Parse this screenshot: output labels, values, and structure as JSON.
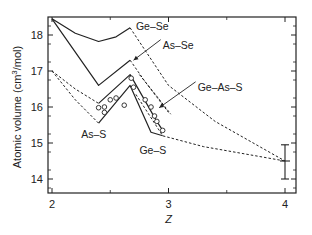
{
  "chart_data": {
    "type": "line",
    "title": "",
    "xlabel": "Z",
    "ylabel": "Atomic volume (cm³/mol)",
    "ylabel_parts": {
      "main": "Atomic volume (cm",
      "sup": "3",
      "tail": "/mol)"
    },
    "xlim": [
      2,
      4.1
    ],
    "ylim": [
      13.6,
      18.5
    ],
    "x_ticks": [
      "2",
      "3",
      "4"
    ],
    "x_tick_values": [
      2,
      3,
      4
    ],
    "y_ticks": [
      "14",
      "15",
      "16",
      "17",
      "18"
    ],
    "y_tick_values": [
      14,
      15,
      16,
      17,
      18
    ],
    "grid": false,
    "legend": "inline labels",
    "series": [
      {
        "name": "Ge–Se",
        "style": "solid",
        "points": [
          [
            2.0,
            18.45
          ],
          [
            2.2,
            18.05
          ],
          [
            2.4,
            17.82
          ],
          [
            2.55,
            17.95
          ],
          [
            2.67,
            18.2
          ]
        ]
      },
      {
        "name": "Ge–Se (extrapolation)",
        "style": "dashed",
        "points": [
          [
            2.67,
            18.2
          ],
          [
            3.0,
            16.6
          ],
          [
            3.4,
            15.6
          ],
          [
            4.0,
            14.5
          ]
        ]
      },
      {
        "name": "As–Se",
        "style": "solid",
        "points": [
          [
            2.0,
            18.45
          ],
          [
            2.4,
            16.6
          ],
          [
            2.67,
            17.3
          ]
        ]
      },
      {
        "name": "As–Se (extrapolation)",
        "style": "dashed",
        "points": [
          [
            2.67,
            17.3
          ],
          [
            2.8,
            16.7
          ],
          [
            3.0,
            15.85
          ]
        ]
      },
      {
        "name": "Ge–As–S",
        "style": "solid",
        "points": [
          [
            2.4,
            16.1
          ],
          [
            2.67,
            16.9
          ],
          [
            2.9,
            15.6
          ],
          [
            2.95,
            15.35
          ]
        ]
      },
      {
        "name": "Ge–As–S (dashed lead)",
        "style": "dashed",
        "points": [
          [
            2.0,
            17.0
          ],
          [
            2.2,
            16.5
          ],
          [
            2.4,
            16.1
          ]
        ]
      },
      {
        "name": "As–S",
        "style": "solid",
        "points": [
          [
            2.4,
            15.55
          ],
          [
            2.67,
            16.6
          ],
          [
            2.85,
            15.3
          ],
          [
            2.95,
            15.2
          ]
        ]
      },
      {
        "name": "As–S (dashed lead)",
        "style": "dashed",
        "points": [
          [
            2.0,
            17.0
          ],
          [
            2.2,
            16.2
          ],
          [
            2.4,
            15.55
          ]
        ]
      },
      {
        "name": "Ge–S (extrapolation)",
        "style": "dashed",
        "points": [
          [
            2.72,
            16.35
          ],
          [
            2.95,
            15.2
          ],
          [
            3.3,
            14.9
          ],
          [
            4.0,
            14.5
          ]
        ]
      },
      {
        "name": "Ge–As–S dashed upper",
        "style": "dashed",
        "points": [
          [
            2.75,
            16.9
          ],
          [
            2.9,
            16.3
          ],
          [
            3.02,
            15.8
          ]
        ]
      }
    ],
    "markers": {
      "symbol": "open-circle",
      "points": [
        [
          2.4,
          15.98
        ],
        [
          2.45,
          15.85
        ],
        [
          2.45,
          16.0
        ],
        [
          2.5,
          16.2
        ],
        [
          2.55,
          16.25
        ],
        [
          2.62,
          16.05
        ],
        [
          2.68,
          16.8
        ],
        [
          2.7,
          16.55
        ],
        [
          2.8,
          16.2
        ],
        [
          2.85,
          16.0
        ],
        [
          2.88,
          15.75
        ],
        [
          2.9,
          15.6
        ],
        [
          2.95,
          15.35
        ]
      ]
    },
    "error_bar": {
      "x": 4.0,
      "y": 14.5,
      "ymin": 14.0,
      "ymax": 14.95
    },
    "annotations": [
      {
        "text": "Ge–Se",
        "x": 2.72,
        "y": 18.15
      },
      {
        "text": "As–Se",
        "x": 2.95,
        "y": 17.62,
        "arrow_to": [
          2.7,
          17.3
        ]
      },
      {
        "text": "Ge–As–S",
        "x": 3.25,
        "y": 16.45,
        "arrow_to": [
          2.92,
          15.98
        ]
      },
      {
        "text": "As–S",
        "x": 2.25,
        "y": 15.15
      },
      {
        "text": "Ge–S",
        "x": 2.75,
        "y": 14.7
      }
    ]
  }
}
